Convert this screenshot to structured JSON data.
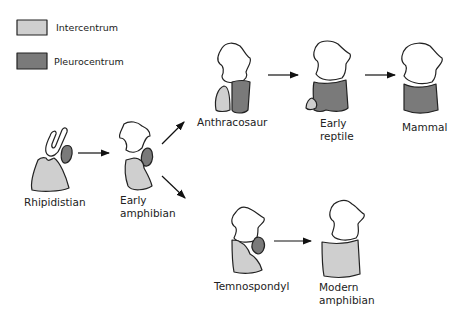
{
  "colors": {
    "intercentrum": "#cfcfcf",
    "pleurocentrum": "#7a7a7a",
    "outline": "#222222",
    "neural_arch": "#ffffff"
  },
  "legend": {
    "items": [
      {
        "label": "Intercentrum",
        "swatch": "#cfcfcf"
      },
      {
        "label": "Pleurocentrum",
        "swatch": "#7a7a7a"
      }
    ]
  },
  "nodes": {
    "rhipidistian": {
      "label": "Rhipidistian"
    },
    "early_amphibian": {
      "label_line1": "Early",
      "label_line2": "amphibian"
    },
    "anthracosaur": {
      "label": "Anthracosaur"
    },
    "early_reptile": {
      "label_line1": "Early",
      "label_line2": "reptile"
    },
    "mammal": {
      "label": "Mammal"
    },
    "temnospondyl": {
      "label": "Temnospondyl"
    },
    "modern_amphibian": {
      "label_line1": "Modern",
      "label_line2": "amphibian"
    }
  },
  "edges": [
    [
      "Rhipidistian",
      "Early amphibian"
    ],
    [
      "Early amphibian",
      "Anthracosaur"
    ],
    [
      "Early amphibian",
      "Temnospondyl"
    ],
    [
      "Anthracosaur",
      "Early reptile"
    ],
    [
      "Early reptile",
      "Mammal"
    ],
    [
      "Temnospondyl",
      "Modern amphibian"
    ]
  ]
}
